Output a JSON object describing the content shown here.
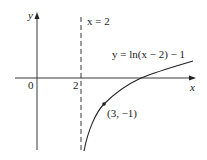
{
  "diagram": {
    "function_label": "y = ln(x − 2) − 1",
    "asymptote_label": "x = 2",
    "point_label": "(3, −1)",
    "axes": {
      "x_label": "x",
      "y_label": "y",
      "origin_label": "0",
      "tick_label": "2"
    },
    "colors": {
      "stroke": "#222222",
      "background": "#ffffff"
    }
  }
}
